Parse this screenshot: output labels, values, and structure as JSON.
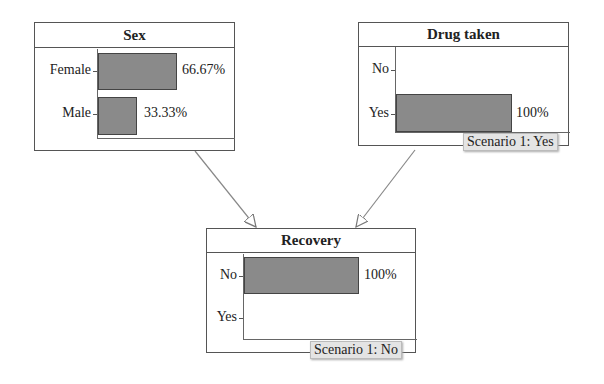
{
  "nodes": {
    "sex": {
      "title": "Sex",
      "states": [
        {
          "label": "Female",
          "value": "66.67%"
        },
        {
          "label": "Male",
          "value": "33.33%"
        }
      ]
    },
    "drug": {
      "title": "Drug taken",
      "states": [
        {
          "label": "No",
          "value": ""
        },
        {
          "label": "Yes",
          "value": "100%"
        }
      ],
      "scenario": "Scenario 1: Yes"
    },
    "recovery": {
      "title": "Recovery",
      "states": [
        {
          "label": "No",
          "value": "100%"
        },
        {
          "label": "Yes",
          "value": ""
        }
      ],
      "scenario": "Scenario 1: No"
    }
  },
  "edges": [
    {
      "from": "Sex",
      "to": "Recovery"
    },
    {
      "from": "Drug taken",
      "to": "Recovery"
    }
  ],
  "colors": {
    "bar": "#8a8a8a",
    "scenario_bg": "#e4e4e4"
  }
}
